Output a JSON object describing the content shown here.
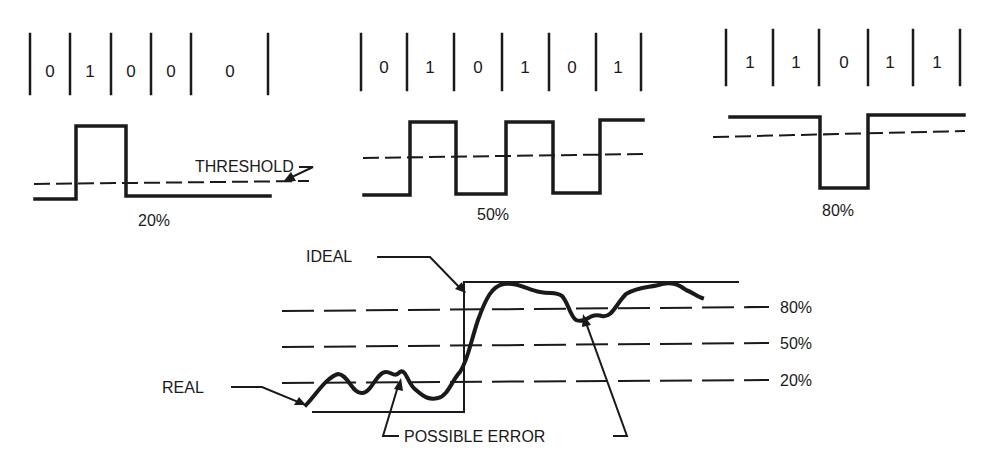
{
  "panels": [
    {
      "bits": [
        "0",
        "1",
        "0",
        "0",
        "0"
      ],
      "caption": "20%"
    },
    {
      "bits": [
        "0",
        "1",
        "0",
        "1",
        "0",
        "1"
      ],
      "caption": "50%"
    },
    {
      "bits": [
        "1",
        "1",
        "0",
        "1",
        "1"
      ],
      "caption": "80%"
    }
  ],
  "threshold_label": "THRESHOLD",
  "bottom": {
    "ideal_label": "IDEAL",
    "real_label": "REAL",
    "error_label": "POSSIBLE ERROR",
    "levels": [
      "80%",
      "50%",
      "20%"
    ]
  },
  "colors": {
    "ink": "#1a1a1a",
    "background": "#ffffff"
  }
}
